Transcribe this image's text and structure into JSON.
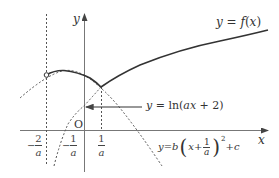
{
  "diagram": {
    "axes": {
      "x_label": "x",
      "y_label": "y",
      "origin_label": "O"
    },
    "curves": {
      "f": {
        "label": "y = f(x)",
        "label_parts": [
          "y",
          " = ",
          "f",
          "(",
          "x",
          ")"
        ]
      },
      "log": {
        "label": "y = ln(ax + 2)",
        "label_parts": [
          "y",
          " = ln(",
          "a",
          "x",
          " + 2)"
        ]
      },
      "parabola": {
        "label": "y = b(x + 1/a)^2 + c",
        "label_parts": [
          "y",
          " = ",
          "b",
          "x",
          " + ",
          "1",
          "a",
          "2",
          " + ",
          "c"
        ]
      }
    },
    "ticks": [
      {
        "sign": "−",
        "num": "2",
        "den": "a",
        "value": "-2/a"
      },
      {
        "sign": "−",
        "num": "1",
        "den": "a",
        "value": "-1/a"
      },
      {
        "sign": "",
        "num": "1",
        "den": "a",
        "value": "1/a"
      }
    ],
    "colors": {
      "solid": "#333333",
      "dashed": "#555555",
      "axis": "#777777"
    }
  }
}
